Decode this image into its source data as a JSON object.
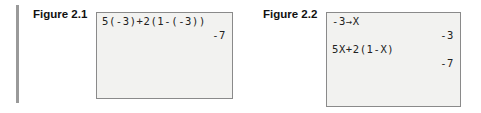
{
  "figures": [
    {
      "label": "Figure 2.1",
      "lines": [
        {
          "text": "5(-3)+2(1-(-3))",
          "align": "left"
        },
        {
          "text": "-7",
          "align": "right"
        }
      ]
    },
    {
      "label": "Figure 2.2",
      "lines": [
        {
          "text": "-3→X",
          "align": "left"
        },
        {
          "text": "-3",
          "align": "right"
        },
        {
          "text": "5X+2(1-X)",
          "align": "left"
        },
        {
          "text": "-7",
          "align": "right"
        }
      ]
    }
  ]
}
